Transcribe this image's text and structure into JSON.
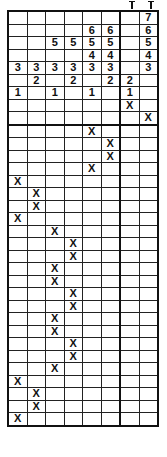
{
  "puzzle": {
    "columns": 8,
    "header_rows": [
      [
        "",
        "",
        "",
        "",
        "",
        "",
        "",
        "7"
      ],
      [
        "",
        "",
        "",
        "",
        "6",
        "6",
        "",
        "6"
      ],
      [
        "",
        "",
        "5",
        "5",
        "5",
        "5",
        "",
        "5"
      ],
      [
        "",
        "",
        "",
        "",
        "4",
        "4",
        "",
        "4"
      ],
      [
        "3",
        "3",
        "3",
        "3",
        "3",
        "3",
        "",
        "3"
      ],
      [
        "",
        "2",
        "",
        "2",
        "",
        "2",
        "2",
        ""
      ],
      [
        "1",
        "",
        "1",
        "",
        "1",
        "",
        "1",
        ""
      ],
      [
        "",
        "",
        "",
        "",
        "",
        "",
        "X",
        ""
      ],
      [
        "",
        "",
        "",
        "",
        "",
        "",
        "",
        "X"
      ]
    ],
    "x_column_per_row": [
      5,
      6,
      6,
      5,
      1,
      2,
      2,
      1,
      3,
      4,
      4,
      3,
      3,
      4,
      4,
      3,
      3,
      4,
      4,
      3,
      1,
      2,
      2,
      1
    ],
    "mark": "X"
  }
}
